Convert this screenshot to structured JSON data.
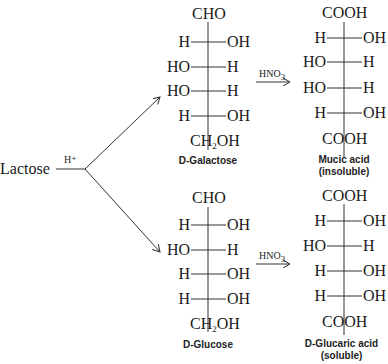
{
  "start": {
    "label": "Lactose",
    "reagent": "H⁺"
  },
  "reagent_oxidation": "HNO",
  "reagent_oxidation_sub": "3",
  "top": {
    "sugar": {
      "top_group": "CHO",
      "rows": [
        {
          "left": "H",
          "right": "OH"
        },
        {
          "left": "HO",
          "right": "H"
        },
        {
          "left": "HO",
          "right": "H"
        },
        {
          "left": "H",
          "right": "OH"
        }
      ],
      "bottom_group": "CH",
      "bottom_sub": "2",
      "bottom_tail": "OH",
      "name": "D-Galactose"
    },
    "acid": {
      "top_group": "COOH",
      "rows": [
        {
          "left": "H",
          "right": "OH"
        },
        {
          "left": "HO",
          "right": "H"
        },
        {
          "left": "HO",
          "right": "H"
        },
        {
          "left": "H",
          "right": "OH"
        }
      ],
      "bottom_group": "COOH",
      "name": "Mucic acid",
      "note": "(insoluble)"
    }
  },
  "bottom": {
    "sugar": {
      "top_group": "CHO",
      "rows": [
        {
          "left": "H",
          "right": "OH"
        },
        {
          "left": "HO",
          "right": "H"
        },
        {
          "left": "H",
          "right": "OH"
        },
        {
          "left": "H",
          "right": "OH"
        }
      ],
      "bottom_group": "CH",
      "bottom_sub": "2",
      "bottom_tail": "OH",
      "name": "D-Glucose"
    },
    "acid": {
      "top_group": "COOH",
      "rows": [
        {
          "left": "H",
          "right": "OH"
        },
        {
          "left": "HO",
          "right": "H"
        },
        {
          "left": "H",
          "right": "OH"
        },
        {
          "left": "H",
          "right": "OH"
        }
      ],
      "bottom_group": "COOH",
      "name": "D-Glucaric acid",
      "note": "(soluble)"
    }
  }
}
